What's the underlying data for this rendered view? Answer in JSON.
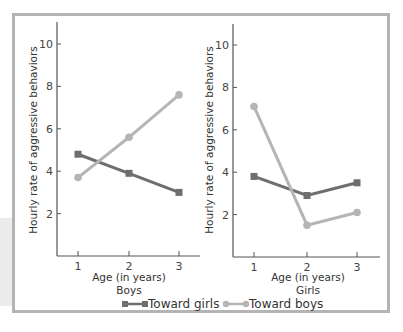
{
  "chart_data": [
    {
      "type": "line",
      "panel": "Boys",
      "title": "",
      "xlabel": "Age (in years)",
      "subtitle": "Boys",
      "ylabel": "Hourly rate of aggressive behaviors",
      "x": [
        1,
        2,
        3
      ],
      "x_tick_labels": [
        "1",
        "2",
        "3"
      ],
      "y_tick_labels": [
        "2",
        "4",
        "6",
        "8",
        "10"
      ],
      "ylim": [
        0,
        11
      ],
      "grid": false,
      "series": [
        {
          "name": "Toward girls",
          "marker": "square",
          "color": "#6e6e6e",
          "values": [
            4.8,
            3.9,
            3.0
          ]
        },
        {
          "name": "Toward boys",
          "marker": "circle",
          "color": "#b5b5b5",
          "values": [
            3.7,
            5.6,
            7.6
          ]
        }
      ]
    },
    {
      "type": "line",
      "panel": "Girls",
      "title": "",
      "xlabel": "Age (in years)",
      "subtitle": "Girls",
      "ylabel": "Hourly rate of aggressive behaviors",
      "x": [
        1,
        2,
        3
      ],
      "x_tick_labels": [
        "1",
        "2",
        "3"
      ],
      "y_tick_labels": [
        "2",
        "4",
        "6",
        "8",
        "10"
      ],
      "ylim": [
        0,
        11
      ],
      "grid": false,
      "series": [
        {
          "name": "Toward girls",
          "marker": "square",
          "color": "#6e6e6e",
          "values": [
            3.8,
            2.9,
            3.5
          ]
        },
        {
          "name": "Toward boys",
          "marker": "circle",
          "color": "#b5b5b5",
          "values": [
            7.1,
            1.5,
            2.1
          ]
        }
      ]
    }
  ],
  "legend": {
    "position": "bottom",
    "items": [
      {
        "label": "Toward girls",
        "marker": "square",
        "color": "#6e6e6e"
      },
      {
        "label": "Toward boys",
        "marker": "circle",
        "color": "#b5b5b5"
      }
    ]
  },
  "labels": {
    "left": {
      "ylabel": "Hourly rate of aggressive behaviors",
      "xlabel": "Age (in years)",
      "group": "Boys"
    },
    "right": {
      "ylabel": "Hourly rate of aggressive behaviors",
      "xlabel": "Age (in years)",
      "group": "Girls"
    },
    "legend_girls": "Toward girls",
    "legend_boys": "Toward boys"
  },
  "colors": {
    "frame": "#b4b4b4",
    "axis": "#555555",
    "dark_series": "#6e6e6e",
    "light_series": "#b5b5b5"
  }
}
